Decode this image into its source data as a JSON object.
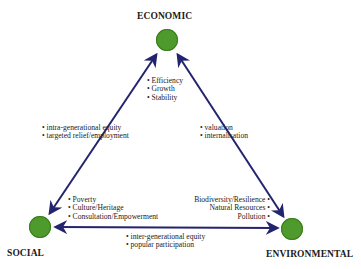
{
  "nodes": {
    "economic": {
      "label": "ECONOMIC",
      "color": "#4f9a2c"
    },
    "social": {
      "label": "SOCIAL",
      "color": "#4f9a2c"
    },
    "environmental": {
      "label": "ENVIRONMENTAL",
      "color": "#4f9a2c"
    }
  },
  "edge_color": "#23236e",
  "node_attributes": {
    "economic": [
      "Efficiency",
      "Growth",
      "Stability"
    ],
    "social": [
      "Poverty",
      "Culture/Heritage",
      "Consultation/Empowerment"
    ],
    "environmental": [
      "Biodiversity/Resilience",
      "Natural Resources",
      "Pollution"
    ]
  },
  "edges": {
    "social_economic": [
      "intra-generational equity",
      "targeted relief/employment"
    ],
    "economic_environmental": [
      "valuation",
      "internalisation"
    ],
    "social_environmental": [
      "inter-generational equity",
      "popular participation"
    ]
  }
}
